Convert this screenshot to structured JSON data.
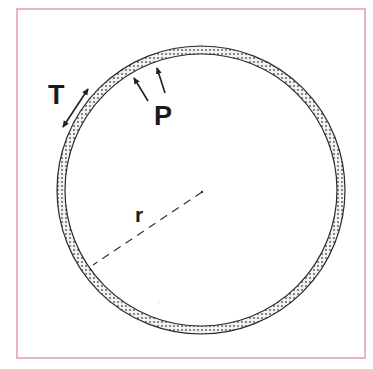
{
  "figure": {
    "frame_color": "#eab4c2",
    "ink_color": "#1f1f1f",
    "labels": {
      "tension": "T",
      "pressure": "P",
      "radius": "r"
    },
    "circle": {
      "cx": 201,
      "cy": 190,
      "outer_r": 144,
      "inner_r": 136
    }
  }
}
